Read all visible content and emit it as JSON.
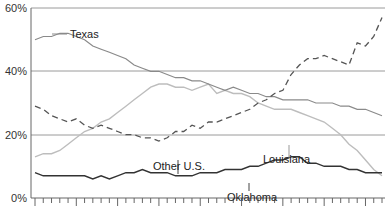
{
  "chart_data": {
    "type": "line",
    "title": "",
    "xlabel": "",
    "ylabel": "",
    "ylim": [
      0,
      60
    ],
    "y_ticks": [
      "0%",
      "20%",
      "40%",
      "60%"
    ],
    "y_tick_values": [
      0,
      20,
      40,
      60
    ],
    "grid": "horizontal at 20% intervals",
    "x_tick_count": 43,
    "x_major_every": 5,
    "x": [
      0,
      1,
      2,
      3,
      4,
      5,
      6,
      7,
      8,
      9,
      10,
      11,
      12,
      13,
      14,
      15,
      16,
      17,
      18,
      19,
      20,
      21,
      22,
      23,
      24,
      25,
      26,
      27,
      28,
      29,
      30,
      31,
      32,
      33,
      34,
      35,
      36,
      37,
      38,
      39,
      40,
      41,
      42
    ],
    "series": [
      {
        "name": "Texas",
        "style": "solid-gray",
        "color": "#8a8a8a",
        "values": [
          50,
          51,
          51,
          52,
          52,
          51,
          50,
          48,
          47,
          46,
          45,
          44,
          42,
          41,
          40,
          40,
          39,
          38,
          38,
          37,
          37,
          36,
          35,
          34,
          35,
          34,
          33,
          33,
          32,
          32,
          31,
          31,
          31,
          31,
          30,
          30,
          30,
          29,
          29,
          28,
          28,
          27,
          26
        ]
      },
      {
        "name": "Louisiana",
        "style": "solid-light-gray",
        "color": "#bdbdbd",
        "values": [
          13,
          14,
          14,
          15,
          17,
          19,
          21,
          22,
          24,
          25,
          27,
          29,
          31,
          33,
          35,
          36,
          36,
          35,
          35,
          34,
          35,
          36,
          33,
          34,
          33,
          33,
          32,
          30,
          29,
          28,
          28,
          28,
          27,
          26,
          25,
          24,
          22,
          20,
          17,
          15,
          12,
          9,
          7
        ]
      },
      {
        "name": "Other U.S.",
        "style": "dashed",
        "color": "#555555",
        "values": [
          29,
          28,
          26,
          25,
          24,
          25,
          23,
          22,
          23,
          22,
          21,
          20,
          20,
          19,
          19,
          18,
          19,
          21,
          21,
          23,
          22,
          24,
          24,
          25,
          26,
          27,
          28,
          30,
          31,
          33,
          34,
          39,
          42,
          44,
          44,
          45,
          44,
          43,
          42,
          49,
          48,
          51,
          57
        ]
      },
      {
        "name": "Oklahoma",
        "style": "solid-dark",
        "color": "#333333",
        "values": [
          8,
          7,
          7,
          7,
          7,
          7,
          7,
          6,
          7,
          6,
          7,
          8,
          8,
          9,
          8,
          8,
          8,
          7,
          7,
          7,
          8,
          8,
          8,
          9,
          9,
          9,
          10,
          10,
          11,
          12,
          12,
          13,
          13,
          11,
          11,
          10,
          10,
          10,
          9,
          9,
          8,
          8,
          8
        ]
      }
    ],
    "annotations": [
      {
        "label": "Texas",
        "x": 3,
        "y": 52
      },
      {
        "label": "Other U.S.",
        "x": 16,
        "y": 20
      },
      {
        "label": "Louisiana",
        "x": 31,
        "y": 24
      },
      {
        "label": "Oklahoma",
        "x": 23,
        "y": 12
      }
    ],
    "legend": "none (inline labels)"
  },
  "labels": {
    "y0": "0%",
    "y20": "20%",
    "y40": "40%",
    "y60": "60%",
    "texas": "Texas",
    "louisiana": "Louisiana",
    "other_us": "Other U.S.",
    "oklahoma": "Oklahoma"
  }
}
